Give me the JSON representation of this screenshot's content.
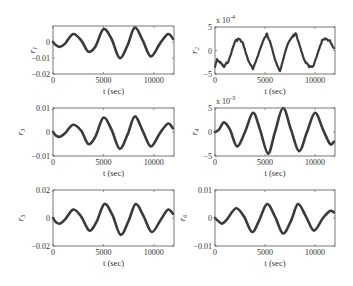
{
  "chart_data": [
    {
      "type": "line",
      "panel": 1,
      "ylabel": "r_1",
      "xlabel": "t (sec)",
      "xlim": [
        0,
        12000
      ],
      "ylim": [
        -0.02,
        0.01
      ],
      "xticks": [
        "0",
        "5000",
        "10000"
      ],
      "yticks": [
        "0",
        "-0.01",
        "-0.02"
      ],
      "ytick_values": [
        0,
        -0.01,
        -0.02
      ],
      "exponent": "",
      "series": [
        {
          "name": "r1",
          "x": [
            0,
            300,
            700,
            1200,
            2000,
            2800,
            3500,
            4200,
            5000,
            5800,
            6600,
            7400,
            8100,
            8900,
            9700,
            10600,
            11400,
            11900
          ],
          "values": [
            0,
            -0.002,
            -0.003,
            -0.001,
            0.005,
            0.001,
            -0.006,
            -0.003,
            0.008,
            0.002,
            -0.01,
            -0.002,
            0.009,
            0.001,
            -0.009,
            -0.001,
            0.005,
            0.002
          ]
        }
      ]
    },
    {
      "type": "line",
      "panel": 2,
      "ylabel": "r_2",
      "xlabel": "t (sec)",
      "xlim": [
        0,
        12000
      ],
      "ylim": [
        -5,
        5
      ],
      "xticks": [
        "0",
        "5000",
        "10000"
      ],
      "yticks": [
        "5",
        "0",
        "-5"
      ],
      "ytick_values": [
        5,
        0,
        -5
      ],
      "exponent": "x 10^-4",
      "noisy": true,
      "series": [
        {
          "name": "r2",
          "x": [
            0,
            200,
            500,
            900,
            1400,
            2000,
            2400,
            2800,
            3300,
            3800,
            4300,
            4800,
            5200,
            5500,
            6000,
            6500,
            6800,
            7200,
            7700,
            8100,
            8400,
            8900,
            9400,
            9800,
            10200,
            10700,
            11100,
            11500,
            11900
          ],
          "values": [
            -3.5,
            -2,
            -2.5,
            -3.5,
            -2,
            2,
            2.5,
            1.5,
            -2,
            -4,
            -1,
            2,
            3.5,
            2,
            -2,
            -4.5,
            -2,
            1,
            3,
            3.5,
            1.5,
            -2,
            -3.5,
            -3.5,
            -1,
            2,
            2.5,
            2,
            0.5
          ]
        }
      ]
    },
    {
      "type": "line",
      "panel": 3,
      "ylabel": "r_3",
      "xlabel": "t (sec)",
      "xlim": [
        0,
        12000
      ],
      "ylim": [
        -0.01,
        0.01
      ],
      "xticks": [
        "0",
        "5000",
        "10000"
      ],
      "yticks": [
        "0.01",
        "0",
        "-0.01"
      ],
      "ytick_values": [
        0.01,
        0,
        -0.01
      ],
      "exponent": "",
      "series": [
        {
          "name": "r3",
          "x": [
            0,
            300,
            700,
            1200,
            2000,
            2800,
            3500,
            4200,
            5000,
            5800,
            6600,
            7400,
            8100,
            8900,
            9700,
            10600,
            11400,
            11900
          ],
          "values": [
            0,
            -0.0015,
            -0.002,
            -0.0005,
            0.003,
            0.0005,
            -0.005,
            -0.002,
            0.006,
            0.001,
            -0.007,
            -0.001,
            0.0065,
            0.0005,
            -0.006,
            -0.0005,
            0.0035,
            0.0015
          ]
        }
      ]
    },
    {
      "type": "line",
      "panel": 4,
      "ylabel": "r_4",
      "xlabel": "t (sec)",
      "xlim": [
        0,
        12000
      ],
      "ylim": [
        -5,
        5
      ],
      "xticks": [
        "0",
        "5000",
        "10000"
      ],
      "yticks": [
        "5",
        "0",
        "-5"
      ],
      "ytick_values": [
        5,
        0,
        -5
      ],
      "exponent": "x 10^-3",
      "series": [
        {
          "name": "r4",
          "x": [
            0,
            400,
            900,
            1500,
            2200,
            3000,
            3800,
            4500,
            5300,
            6000,
            6800,
            7600,
            8400,
            9200,
            10000,
            10800,
            11500,
            11900
          ],
          "values": [
            0,
            0.5,
            2,
            0.5,
            -3,
            0,
            4,
            0.5,
            -4.5,
            0,
            5,
            0.5,
            -4,
            0,
            4,
            0.5,
            -2.5,
            -2
          ]
        }
      ]
    },
    {
      "type": "line",
      "panel": 5,
      "ylabel": "r_5",
      "xlabel": "t (sec)",
      "xlim": [
        0,
        12000
      ],
      "ylim": [
        -0.02,
        0.02
      ],
      "xticks": [
        "0",
        "5000",
        "10000"
      ],
      "yticks": [
        "0.02",
        "0",
        "-0.02"
      ],
      "ytick_values": [
        0.02,
        0,
        -0.02
      ],
      "exponent": "",
      "series": [
        {
          "name": "r5",
          "x": [
            0,
            300,
            700,
            1200,
            2000,
            2800,
            3600,
            4300,
            5100,
            5900,
            6700,
            7500,
            8200,
            9000,
            9800,
            10700,
            11400,
            11900
          ],
          "values": [
            0,
            -0.003,
            -0.004,
            -0.001,
            0.006,
            0.001,
            -0.009,
            -0.003,
            0.01,
            0.002,
            -0.012,
            -0.002,
            0.01,
            0.001,
            -0.01,
            -0.001,
            0.006,
            0.003
          ]
        }
      ]
    },
    {
      "type": "line",
      "panel": 6,
      "ylabel": "r_6",
      "xlabel": "t (sec)",
      "xlim": [
        0,
        12000
      ],
      "ylim": [
        -0.01,
        0.01
      ],
      "xticks": [
        "0",
        "5000",
        "10000"
      ],
      "yticks": [
        "0.01",
        "0",
        "-0.01"
      ],
      "ytick_values": [
        0.01,
        0,
        -0.01
      ],
      "exponent": "",
      "series": [
        {
          "name": "r6",
          "x": [
            0,
            300,
            700,
            1200,
            2100,
            2900,
            3700,
            4400,
            5200,
            6000,
            6800,
            7600,
            8300,
            9100,
            9900,
            10800,
            11500,
            11900
          ],
          "values": [
            0,
            -0.001,
            -0.002,
            -0.0005,
            0.0035,
            0.0005,
            -0.005,
            -0.001,
            0.005,
            0.0005,
            -0.0055,
            -0.001,
            0.005,
            0.0005,
            -0.0045,
            0,
            0.0025,
            0.002
          ]
        }
      ]
    }
  ],
  "layout": {
    "panels": [
      {
        "x": 53,
        "y": 26,
        "w": 121,
        "h": 48
      },
      {
        "x": 215,
        "y": 27,
        "w": 120,
        "h": 47
      },
      {
        "x": 53,
        "y": 108,
        "w": 121,
        "h": 48
      },
      {
        "x": 215,
        "y": 108,
        "w": 120,
        "h": 48
      },
      {
        "x": 53,
        "y": 190,
        "w": 121,
        "h": 56
      },
      {
        "x": 215,
        "y": 190,
        "w": 120,
        "h": 56
      }
    ]
  }
}
